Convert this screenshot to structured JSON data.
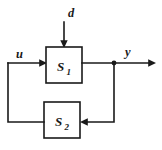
{
  "diagram": {
    "type": "control-system-block-diagram",
    "background_color": "#ffffff",
    "line_color": "#1a1a1a",
    "blocks": [
      {
        "id": "S1",
        "label_base": "S",
        "label_sub": "1",
        "label_full": "S₁",
        "x": 46,
        "y": 47,
        "width": 36,
        "height": 36
      },
      {
        "id": "S2",
        "label_base": "S",
        "label_sub": "2",
        "label_full": "S₂",
        "x": 44,
        "y": 102,
        "width": 36,
        "height": 36
      }
    ],
    "signals": [
      {
        "id": "d",
        "label": "d",
        "role": "disturbance-input",
        "direction": "down-into-S1-top",
        "label_x": 68,
        "label_y": 17
      },
      {
        "id": "u",
        "label": "u",
        "role": "control-input",
        "direction": "right-into-S1-left",
        "label_x": 17,
        "label_y": 58
      },
      {
        "id": "y",
        "label": "y",
        "role": "output",
        "direction": "right-out-of-S1",
        "label_x": 125,
        "label_y": 56
      }
    ],
    "junctions": [
      {
        "id": "y-tap",
        "x": 114,
        "y": 63
      }
    ],
    "paths": [
      {
        "id": "d-path",
        "desc": "d down into S1 top"
      },
      {
        "id": "u-path",
        "desc": "u right into S1 left"
      },
      {
        "id": "y-path",
        "desc": "S1 right out to y arrow"
      },
      {
        "id": "feedback-down",
        "desc": "y tap down then left into S2 right"
      },
      {
        "id": "feedback-return",
        "desc": "S2 left out, left then up, right into S1 left"
      }
    ]
  }
}
